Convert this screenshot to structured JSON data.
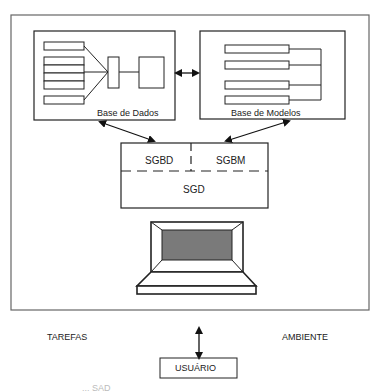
{
  "diagram": {
    "database": {
      "label": "Base de Dados"
    },
    "model_base": {
      "label": "Base de Modelos"
    },
    "manager": {
      "sgbd": "SGBD",
      "sgbm": "SGBM",
      "sgd": "SGD"
    },
    "tasks_label": "TAREFAS",
    "environment_label": "AMBIENTE",
    "user_label": "USUÁRIO",
    "caption_fragment": "... SAD"
  },
  "colors": {
    "line": "#222222",
    "screen": "#7a7a7a",
    "frame": "#666666"
  }
}
